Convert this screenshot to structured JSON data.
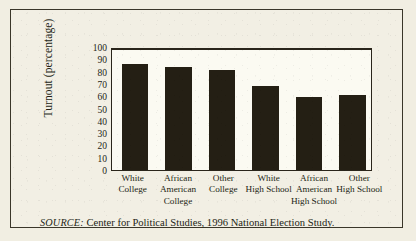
{
  "figure": {
    "source_prefix": "SOURCE:",
    "source_text": "Center for Political Studies, 1996 National Election Study.",
    "background_color": "#f1eee2",
    "ink_color": "#241f14",
    "frame_color": "#2a251b"
  },
  "chart_data": {
    "type": "bar",
    "title": "",
    "xlabel": "",
    "ylabel": "Turnout (percentage)",
    "ylim": [
      0,
      100
    ],
    "ytick_step": 10,
    "yticks": [
      0,
      10,
      20,
      30,
      40,
      50,
      60,
      70,
      80,
      90,
      100
    ],
    "ytick_labels": [
      "0",
      "10",
      "20",
      "30",
      "40",
      "50",
      "60",
      "70",
      "80",
      "90",
      "100"
    ],
    "grid": false,
    "legend": false,
    "legend_position": "none",
    "categories": [
      "White College",
      "African American College",
      "Other College",
      "White High School",
      "African American High School",
      "Other High School"
    ],
    "category_lines": [
      [
        "White",
        "College"
      ],
      [
        "African",
        "American",
        "College"
      ],
      [
        "Other",
        "College"
      ],
      [
        "White",
        "High School"
      ],
      [
        "African",
        "American",
        "High School"
      ],
      [
        "Other",
        "High School"
      ]
    ],
    "values": [
      86,
      84,
      81,
      68,
      59,
      61
    ],
    "bar_color": "#241f14"
  }
}
